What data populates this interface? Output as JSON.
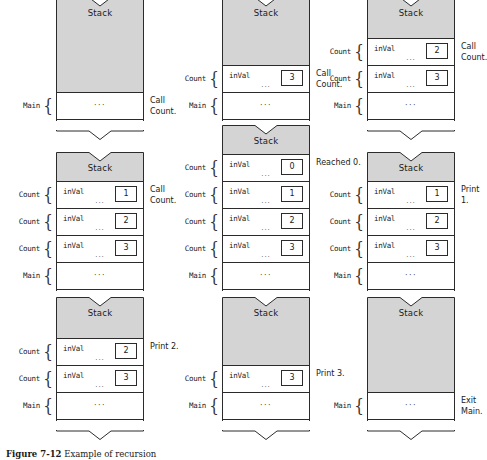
{
  "figure": {
    "caption_label": "Figure 7-12",
    "caption_text": "Example of recursion",
    "stack_title": "Stack",
    "var_name": "inVal",
    "ellipsis": "···",
    "label_count": "Count",
    "label_main": "Main",
    "colors": {
      "stack_unused_fill": "#d4d4d4",
      "frame_fill": "#ffffff",
      "line": "#2b2b2b",
      "text": "#1a1a1a"
    }
  },
  "panels": [
    {
      "id": "panel-1",
      "title": "Stack",
      "annotation": "Call\nCount.",
      "frames": [
        {
          "label": "Main",
          "var": null,
          "value": null,
          "kind": "main"
        }
      ]
    },
    {
      "id": "panel-2",
      "title": "Stack",
      "annotation": "Call\nCount.",
      "frames": [
        {
          "label": "Count",
          "var": "inVal",
          "value": "3",
          "kind": "call"
        },
        {
          "label": "Main",
          "var": null,
          "value": null,
          "kind": "main"
        }
      ]
    },
    {
      "id": "panel-3",
      "title": "Stack",
      "annotation": "Call\nCount.",
      "frames": [
        {
          "label": "Count",
          "var": "inVal",
          "value": "2",
          "kind": "call"
        },
        {
          "label": "Count",
          "var": "inVal",
          "value": "3",
          "kind": "call"
        },
        {
          "label": "Main",
          "var": null,
          "value": null,
          "kind": "main"
        }
      ]
    },
    {
      "id": "panel-4",
      "title": "Stack",
      "annotation": "Call\nCount.",
      "frames": [
        {
          "label": "Count",
          "var": "inVal",
          "value": "1",
          "kind": "call"
        },
        {
          "label": "Count",
          "var": "inVal",
          "value": "2",
          "kind": "call"
        },
        {
          "label": "Count",
          "var": "inVal",
          "value": "3",
          "kind": "call"
        },
        {
          "label": "Main",
          "var": null,
          "value": null,
          "kind": "main"
        }
      ]
    },
    {
      "id": "panel-5",
      "title": "Stack",
      "annotation": "Reached 0.",
      "frames": [
        {
          "label": "Count",
          "var": "inVal",
          "value": "0",
          "kind": "call"
        },
        {
          "label": "Count",
          "var": "inVal",
          "value": "1",
          "kind": "call"
        },
        {
          "label": "Count",
          "var": "inVal",
          "value": "2",
          "kind": "call"
        },
        {
          "label": "Count",
          "var": "inVal",
          "value": "3",
          "kind": "call"
        },
        {
          "label": "Main",
          "var": null,
          "value": null,
          "kind": "main"
        }
      ]
    },
    {
      "id": "panel-6",
      "title": "Stack",
      "annotation": "Print 1.",
      "frames": [
        {
          "label": "Count",
          "var": "inVal",
          "value": "1",
          "kind": "call"
        },
        {
          "label": "Count",
          "var": "inVal",
          "value": "2",
          "kind": "call"
        },
        {
          "label": "Count",
          "var": "inVal",
          "value": "3",
          "kind": "call"
        },
        {
          "label": "Main",
          "var": null,
          "value": null,
          "kind": "main"
        }
      ]
    },
    {
      "id": "panel-7",
      "title": "Stack",
      "annotation": "Print 2.",
      "frames": [
        {
          "label": "Count",
          "var": "inVal",
          "value": "2",
          "kind": "call"
        },
        {
          "label": "Count",
          "var": "inVal",
          "value": "3",
          "kind": "call"
        },
        {
          "label": "Main",
          "var": null,
          "value": null,
          "kind": "main"
        }
      ]
    },
    {
      "id": "panel-8",
      "title": "Stack",
      "annotation": "Print 3.",
      "frames": [
        {
          "label": "Count",
          "var": "inVal",
          "value": "3",
          "kind": "call"
        },
        {
          "label": "Main",
          "var": null,
          "value": null,
          "kind": "main"
        }
      ]
    },
    {
      "id": "panel-9",
      "title": "Stack",
      "annotation": "Exit\nMain.",
      "frames": [
        {
          "label": "Main",
          "var": null,
          "value": null,
          "kind": "main"
        }
      ]
    }
  ],
  "layout": {
    "columns_x": [
      56,
      222,
      367
    ],
    "rows_bottom_y": [
      140,
      310,
      440
    ],
    "stack_width": 88,
    "frame_height": 27,
    "header_min_height": 14
  }
}
